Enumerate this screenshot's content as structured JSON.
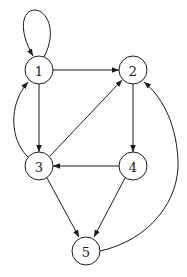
{
  "diagram": {
    "type": "directed-graph",
    "nodes": [
      {
        "id": "1",
        "label": "1"
      },
      {
        "id": "2",
        "label": "2"
      },
      {
        "id": "3",
        "label": "3"
      },
      {
        "id": "4",
        "label": "4"
      },
      {
        "id": "5",
        "label": "5"
      }
    ],
    "edges": [
      {
        "from": "1",
        "to": "1",
        "style": "self-loop"
      },
      {
        "from": "1",
        "to": "2",
        "style": "straight"
      },
      {
        "from": "1",
        "to": "3",
        "style": "straight"
      },
      {
        "from": "3",
        "to": "1",
        "style": "curved"
      },
      {
        "from": "3",
        "to": "2",
        "style": "straight"
      },
      {
        "from": "2",
        "to": "4",
        "style": "straight"
      },
      {
        "from": "4",
        "to": "3",
        "style": "straight"
      },
      {
        "from": "3",
        "to": "5",
        "style": "straight"
      },
      {
        "from": "4",
        "to": "5",
        "style": "straight"
      },
      {
        "from": "5",
        "to": "2",
        "style": "curved"
      }
    ]
  }
}
